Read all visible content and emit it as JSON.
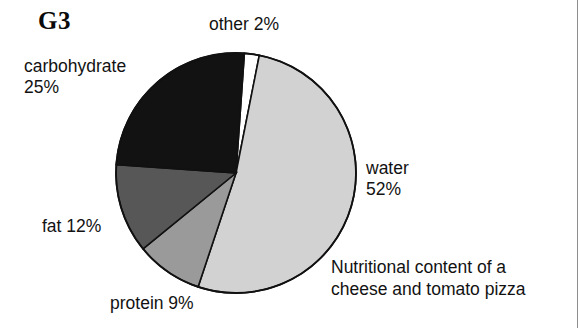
{
  "figure": {
    "id_label": "G3",
    "caption_line1": "Nutritional content of a",
    "caption_line2": "cheese and tomato pizza"
  },
  "labels": {
    "carbohydrate_line1": "carbohydrate",
    "carbohydrate_line2": "25%",
    "other": "other 2%",
    "water_line1": "water",
    "water_line2": "52%",
    "fat": "fat 12%",
    "protein": "protein 9%"
  },
  "chart_data": {
    "type": "pie",
    "categories": [
      "other",
      "water",
      "protein",
      "fat",
      "carbohydrate"
    ],
    "values": [
      2,
      52,
      9,
      12,
      25
    ],
    "value_unit": "%",
    "labels": [
      "other 2%",
      "water 52%",
      "protein 9%",
      "fat 12%",
      "carbohydrate 25%"
    ],
    "colors": [
      "#ffffff",
      "#d2d2d2",
      "#9a9a9a",
      "#575757",
      "#121212"
    ],
    "start_angle_deg": -86,
    "direction": "clockwise",
    "stroke": "#111111",
    "legend": "none",
    "grid": false,
    "center_px": [
      236,
      173
    ],
    "radius_px": 123
  }
}
